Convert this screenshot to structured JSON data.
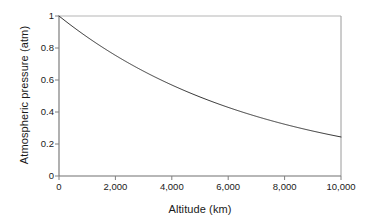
{
  "chart_data": {
    "type": "line",
    "title": "",
    "xlabel": "Altitude (km)",
    "ylabel": "Atmospheric pressure (atm)",
    "xlim": [
      0,
      10000
    ],
    "ylim": [
      0,
      1
    ],
    "grid": false,
    "legend": null,
    "xticks": [
      0,
      2000,
      4000,
      6000,
      8000,
      10000
    ],
    "xtick_labels": [
      "0",
      "2,000",
      "4,000",
      "6,000",
      "8,000",
      "10,000"
    ],
    "yticks": [
      0,
      0.2,
      0.4,
      0.6,
      0.8,
      1
    ],
    "ytick_labels": [
      "0",
      "0.2",
      "0.4",
      "0.6",
      "0.8",
      "1"
    ],
    "series": [
      {
        "name": "Atmospheric pressure",
        "color": "#333333",
        "x": [
          0,
          500,
          1000,
          1500,
          2000,
          2500,
          3000,
          3500,
          4000,
          4500,
          5000,
          5500,
          6000,
          6500,
          7000,
          7500,
          8000,
          8500,
          9000,
          9500,
          10000
        ],
        "values": [
          1.0,
          0.932,
          0.868,
          0.809,
          0.754,
          0.703,
          0.655,
          0.61,
          0.569,
          0.53,
          0.494,
          0.46,
          0.429,
          0.4,
          0.373,
          0.347,
          0.324,
          0.302,
          0.281,
          0.262,
          0.244
        ]
      }
    ],
    "annotations": []
  },
  "axes": {
    "frame_color": "#808080",
    "tick_color": "#808080",
    "curve_color": "#333333",
    "background": "#ffffff"
  }
}
